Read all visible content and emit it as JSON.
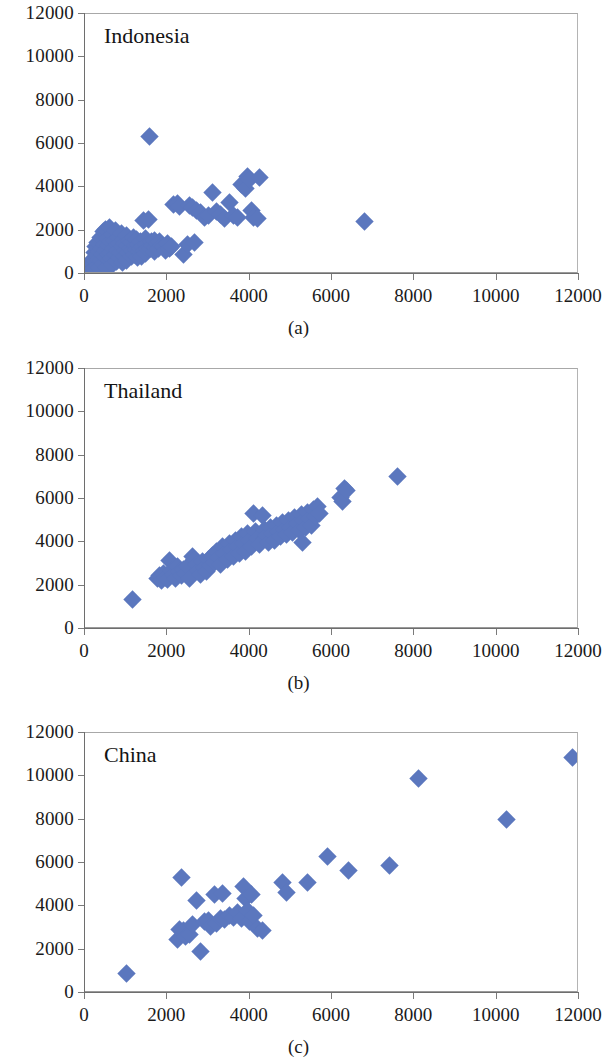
{
  "figure": {
    "background": "#ffffff",
    "marker_color": "#5B77BE",
    "axis_color": "#6e6e6e"
  },
  "panels": [
    {
      "caption": "(a)",
      "title": "Indonesia",
      "axis": {
        "xlim": [
          0,
          12000
        ],
        "ylim": [
          0,
          12000
        ],
        "xticks": [
          0,
          2000,
          4000,
          6000,
          8000,
          10000,
          12000
        ],
        "yticks": [
          0,
          2000,
          4000,
          6000,
          8000,
          10000,
          12000
        ],
        "xtick_labels": [
          "0",
          "2000",
          "4000",
          "6000",
          "8000",
          "10000",
          "12000"
        ],
        "ytick_labels": [
          "0",
          "2000",
          "4000",
          "6000",
          "8000",
          "10000",
          "12000"
        ]
      }
    },
    {
      "caption": "(b)",
      "title": "Thailand",
      "axis": {
        "xlim": [
          0,
          12000
        ],
        "ylim": [
          0,
          12000
        ],
        "xticks": [
          0,
          2000,
          4000,
          6000,
          8000,
          10000,
          12000
        ],
        "yticks": [
          0,
          2000,
          4000,
          6000,
          8000,
          10000,
          12000
        ],
        "xtick_labels": [
          "0",
          "2000",
          "4000",
          "6000",
          "8000",
          "10000",
          "12000"
        ],
        "ytick_labels": [
          "0",
          "2000",
          "4000",
          "6000",
          "8000",
          "10000",
          "12000"
        ]
      }
    },
    {
      "caption": "(c)",
      "title": "China",
      "axis": {
        "xlim": [
          0,
          12000
        ],
        "ylim": [
          0,
          12000
        ],
        "xticks": [
          0,
          2000,
          4000,
          6000,
          8000,
          10000,
          12000
        ],
        "yticks": [
          0,
          2000,
          4000,
          6000,
          8000,
          10000,
          12000
        ],
        "xtick_labels": [
          "0",
          "2000",
          "4000",
          "6000",
          "8000",
          "10000",
          "12000"
        ],
        "ytick_labels": [
          "0",
          "2000",
          "4000",
          "6000",
          "8000",
          "10000",
          "12000"
        ]
      }
    }
  ],
  "chart_data": [
    {
      "type": "scatter",
      "title": "Indonesia",
      "subtitle": "(a)",
      "xlabel": "",
      "ylabel": "",
      "xlim": [
        0,
        12000
      ],
      "ylim": [
        0,
        12000
      ],
      "xticks": [
        0,
        2000,
        4000,
        6000,
        8000,
        10000,
        12000
      ],
      "yticks": [
        0,
        2000,
        4000,
        6000,
        8000,
        10000,
        12000
      ],
      "grid": false,
      "legend": null,
      "marker": "diamond",
      "color": "#5B77BE",
      "points": [
        [
          120,
          300
        ],
        [
          150,
          520
        ],
        [
          180,
          430
        ],
        [
          200,
          700
        ],
        [
          210,
          260
        ],
        [
          230,
          980
        ],
        [
          250,
          560
        ],
        [
          260,
          1250
        ],
        [
          280,
          840
        ],
        [
          300,
          380
        ],
        [
          310,
          1450
        ],
        [
          330,
          690
        ],
        [
          350,
          1050
        ],
        [
          360,
          300
        ],
        [
          380,
          1700
        ],
        [
          400,
          620
        ],
        [
          410,
          1180
        ],
        [
          430,
          900
        ],
        [
          450,
          1950
        ],
        [
          460,
          480
        ],
        [
          470,
          1380
        ],
        [
          490,
          760
        ],
        [
          500,
          2050
        ],
        [
          510,
          1100
        ],
        [
          530,
          320
        ],
        [
          540,
          1620
        ],
        [
          560,
          880
        ],
        [
          570,
          1300
        ],
        [
          590,
          620
        ],
        [
          600,
          2150
        ],
        [
          620,
          1000
        ],
        [
          630,
          1480
        ],
        [
          650,
          700
        ],
        [
          660,
          1820
        ],
        [
          680,
          420
        ],
        [
          700,
          1160
        ],
        [
          710,
          1540
        ],
        [
          730,
          900
        ],
        [
          750,
          2000
        ],
        [
          760,
          600
        ],
        [
          780,
          1340
        ],
        [
          800,
          1080
        ],
        [
          810,
          1700
        ],
        [
          830,
          760
        ],
        [
          850,
          1420
        ],
        [
          860,
          980
        ],
        [
          880,
          1880
        ],
        [
          900,
          540
        ],
        [
          910,
          1250
        ],
        [
          930,
          1600
        ],
        [
          950,
          820
        ],
        [
          960,
          1420
        ],
        [
          980,
          1100
        ],
        [
          1000,
          1760
        ],
        [
          1020,
          640
        ],
        [
          1040,
          1300
        ],
        [
          1060,
          980
        ],
        [
          1080,
          1560
        ],
        [
          1100,
          1200
        ],
        [
          1120,
          820
        ],
        [
          1140,
          1440
        ],
        [
          1160,
          1080
        ],
        [
          1180,
          1700
        ],
        [
          1200,
          900
        ],
        [
          1220,
          1320
        ],
        [
          1240,
          1120
        ],
        [
          1260,
          1600
        ],
        [
          1280,
          760
        ],
        [
          1300,
          1380
        ],
        [
          1320,
          1040
        ],
        [
          1340,
          1500
        ],
        [
          1360,
          1180
        ],
        [
          1380,
          820
        ],
        [
          1400,
          1280
        ],
        [
          1420,
          2450
        ],
        [
          1440,
          1080
        ],
        [
          1460,
          1620
        ],
        [
          1480,
          940
        ],
        [
          1500,
          1340
        ],
        [
          1520,
          1200
        ],
        [
          1550,
          2500
        ],
        [
          1560,
          6350
        ],
        [
          1600,
          1160
        ],
        [
          1620,
          1480
        ],
        [
          1650,
          1320
        ],
        [
          1680,
          1060
        ],
        [
          1700,
          1560
        ],
        [
          1720,
          1220
        ],
        [
          1750,
          1400
        ],
        [
          1780,
          1180
        ],
        [
          1800,
          1500
        ],
        [
          1850,
          1320
        ],
        [
          1900,
          1260
        ],
        [
          1950,
          1100
        ],
        [
          2000,
          1420
        ],
        [
          2050,
          1200
        ],
        [
          2100,
          1280
        ],
        [
          2150,
          3200
        ],
        [
          2250,
          3250
        ],
        [
          2300,
          3100
        ],
        [
          2400,
          900
        ],
        [
          2500,
          1350
        ],
        [
          2550,
          3150
        ],
        [
          2600,
          3050
        ],
        [
          2650,
          1450
        ],
        [
          2700,
          2950
        ],
        [
          2800,
          2850
        ],
        [
          2900,
          2600
        ],
        [
          3000,
          2700
        ],
        [
          3100,
          3750
        ],
        [
          3200,
          2900
        ],
        [
          3300,
          2750
        ],
        [
          3400,
          2550
        ],
        [
          3500,
          3300
        ],
        [
          3600,
          2700
        ],
        [
          3700,
          2600
        ],
        [
          3800,
          4150
        ],
        [
          3900,
          3950
        ],
        [
          3950,
          4500
        ],
        [
          4000,
          4350
        ],
        [
          4050,
          2950
        ],
        [
          4100,
          2600
        ],
        [
          4200,
          2550
        ],
        [
          4250,
          4450
        ],
        [
          6800,
          2430
        ]
      ]
    },
    {
      "type": "scatter",
      "title": "Thailand",
      "subtitle": "(b)",
      "xlabel": "",
      "ylabel": "",
      "xlim": [
        0,
        12000
      ],
      "ylim": [
        0,
        12000
      ],
      "xticks": [
        0,
        2000,
        4000,
        6000,
        8000,
        10000,
        12000
      ],
      "yticks": [
        0,
        2000,
        4000,
        6000,
        8000,
        10000,
        12000
      ],
      "grid": false,
      "legend": null,
      "marker": "diamond",
      "color": "#5B77BE",
      "points": [
        [
          1150,
          1380
        ],
        [
          1750,
          2350
        ],
        [
          1800,
          2450
        ],
        [
          1850,
          2250
        ],
        [
          1900,
          2550
        ],
        [
          1950,
          2400
        ],
        [
          2000,
          2300
        ],
        [
          2050,
          3150
        ],
        [
          2100,
          2700
        ],
        [
          2150,
          2500
        ],
        [
          2200,
          2350
        ],
        [
          2250,
          2900
        ],
        [
          2300,
          2650
        ],
        [
          2350,
          2450
        ],
        [
          2400,
          2750
        ],
        [
          2450,
          2550
        ],
        [
          2500,
          2900
        ],
        [
          2550,
          2350
        ],
        [
          2600,
          3350
        ],
        [
          2650,
          3200
        ],
        [
          2700,
          3000
        ],
        [
          2750,
          2700
        ],
        [
          2800,
          2500
        ],
        [
          2850,
          3100
        ],
        [
          2900,
          2850
        ],
        [
          2950,
          2650
        ],
        [
          3000,
          3200
        ],
        [
          3050,
          2950
        ],
        [
          3100,
          3400
        ],
        [
          3150,
          3050
        ],
        [
          3200,
          3600
        ],
        [
          3250,
          3300
        ],
        [
          3300,
          3000
        ],
        [
          3350,
          3800
        ],
        [
          3400,
          3500
        ],
        [
          3450,
          3200
        ],
        [
          3500,
          3950
        ],
        [
          3550,
          3650
        ],
        [
          3600,
          3350
        ],
        [
          3650,
          4100
        ],
        [
          3700,
          3800
        ],
        [
          3750,
          3500
        ],
        [
          3800,
          4250
        ],
        [
          3850,
          3950
        ],
        [
          3900,
          3600
        ],
        [
          3950,
          4400
        ],
        [
          4000,
          4100
        ],
        [
          4050,
          3800
        ],
        [
          4100,
          5350
        ],
        [
          4150,
          4500
        ],
        [
          4200,
          4200
        ],
        [
          4250,
          3900
        ],
        [
          4300,
          5250
        ],
        [
          4350,
          4600
        ],
        [
          4400,
          4300
        ],
        [
          4450,
          4000
        ],
        [
          4500,
          4700
        ],
        [
          4550,
          4400
        ],
        [
          4600,
          4100
        ],
        [
          4650,
          4800
        ],
        [
          4700,
          4500
        ],
        [
          4750,
          4250
        ],
        [
          4800,
          4900
        ],
        [
          4850,
          4600
        ],
        [
          4900,
          4350
        ],
        [
          4950,
          5000
        ],
        [
          5000,
          4700
        ],
        [
          5050,
          4450
        ],
        [
          5100,
          5150
        ],
        [
          5150,
          4850
        ],
        [
          5200,
          4550
        ],
        [
          5250,
          5300
        ],
        [
          5280,
          4000
        ],
        [
          5300,
          5000
        ],
        [
          5350,
          4700
        ],
        [
          5400,
          5400
        ],
        [
          5450,
          5100
        ],
        [
          5500,
          4800
        ],
        [
          5550,
          5500
        ],
        [
          5600,
          5200
        ],
        [
          5650,
          5650
        ],
        [
          5700,
          5350
        ],
        [
          6200,
          6050
        ],
        [
          6250,
          5900
        ],
        [
          6300,
          6500
        ],
        [
          6350,
          6400
        ],
        [
          7600,
          7050
        ]
      ]
    },
    {
      "type": "scatter",
      "title": "China",
      "subtitle": "(c)",
      "xlabel": "",
      "ylabel": "",
      "xlim": [
        0,
        12000
      ],
      "ylim": [
        0,
        12000
      ],
      "xticks": [
        0,
        2000,
        4000,
        6000,
        8000,
        10000,
        12000
      ],
      "yticks": [
        0,
        2000,
        4000,
        6000,
        8000,
        10000,
        12000
      ],
      "grid": false,
      "legend": null,
      "marker": "diamond",
      "color": "#5B77BE",
      "points": [
        [
          1020,
          900
        ],
        [
          2250,
          2450
        ],
        [
          2300,
          2950
        ],
        [
          2350,
          5350
        ],
        [
          2400,
          2900
        ],
        [
          2450,
          2600
        ],
        [
          2550,
          2700
        ],
        [
          2600,
          3150
        ],
        [
          2700,
          4250
        ],
        [
          2800,
          1900
        ],
        [
          2900,
          3300
        ],
        [
          3000,
          3350
        ],
        [
          3050,
          3050
        ],
        [
          3150,
          4550
        ],
        [
          3200,
          3200
        ],
        [
          3300,
          3450
        ],
        [
          3350,
          4600
        ],
        [
          3400,
          3400
        ],
        [
          3500,
          3600
        ],
        [
          3600,
          3500
        ],
        [
          3700,
          3700
        ],
        [
          3800,
          3450
        ],
        [
          3850,
          4900
        ],
        [
          3900,
          4350
        ],
        [
          3950,
          3800
        ],
        [
          4000,
          3300
        ],
        [
          4050,
          4550
        ],
        [
          4100,
          3600
        ],
        [
          4200,
          3000
        ],
        [
          4300,
          2900
        ],
        [
          4800,
          5100
        ],
        [
          4900,
          4650
        ],
        [
          5400,
          5100
        ],
        [
          5900,
          6300
        ],
        [
          6400,
          5650
        ],
        [
          7400,
          5900
        ],
        [
          8100,
          9900
        ],
        [
          10250,
          8000
        ],
        [
          11850,
          10850
        ]
      ]
    }
  ]
}
